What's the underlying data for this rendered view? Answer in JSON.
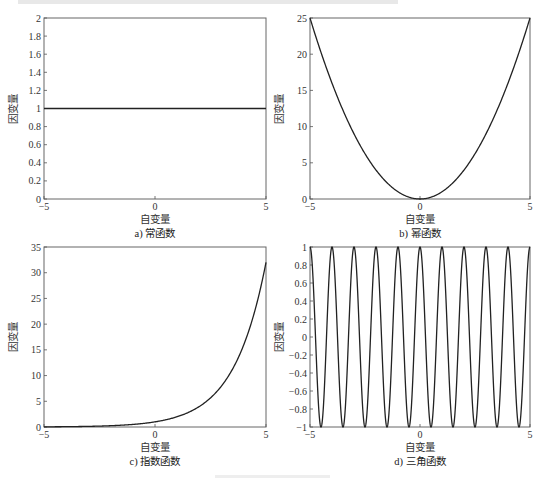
{
  "figure_caption_top": "",
  "chart_data": [
    {
      "id": "a",
      "type": "line",
      "function": "y = 1",
      "title": "",
      "caption": "a) 常函数",
      "xlabel": "自变量",
      "ylabel": "因变量",
      "xlim": [
        -5,
        5
      ],
      "ylim": [
        0,
        2
      ],
      "xticks": [
        -5,
        0,
        5
      ],
      "yticks": [
        0,
        0.2,
        0.4,
        0.6,
        0.8,
        1,
        1.2,
        1.4,
        1.6,
        1.8,
        2
      ],
      "xtick_labels": [
        "−5",
        "0",
        "5"
      ],
      "ytick_labels": [
        "0",
        "0.2",
        "0.4",
        "0.6",
        "0.8",
        "1",
        "1.2",
        "1.4",
        "1.6",
        "1.8",
        "2"
      ],
      "series": [
        {
          "name": "常函数",
          "x": [
            -5,
            5
          ],
          "y": [
            1,
            1
          ]
        }
      ],
      "grid": false
    },
    {
      "id": "b",
      "type": "line",
      "function": "y = x^2",
      "caption": "b) 幂函数",
      "xlabel": "自变量",
      "ylabel": "因变量",
      "xlim": [
        -5,
        5
      ],
      "ylim": [
        0,
        25
      ],
      "xticks": [
        -5,
        0,
        5
      ],
      "yticks": [
        0,
        5,
        10,
        15,
        20,
        25
      ],
      "xtick_labels": [
        "−5",
        "0",
        "5"
      ],
      "ytick_labels": [
        "0",
        "5",
        "10",
        "15",
        "20",
        "25"
      ],
      "series": [
        {
          "name": "幂函数",
          "x": [
            -5,
            -4,
            -3,
            -2,
            -1,
            0,
            1,
            2,
            3,
            4,
            5
          ],
          "y": [
            25,
            16,
            9,
            4,
            1,
            0,
            1,
            4,
            9,
            16,
            25
          ]
        }
      ],
      "grid": false
    },
    {
      "id": "c",
      "type": "line",
      "function": "y = 2^x",
      "caption": "c) 指数函数",
      "xlabel": "自变量",
      "ylabel": "因变量",
      "xlim": [
        -5,
        5
      ],
      "ylim": [
        0,
        35
      ],
      "xticks": [
        -5,
        0,
        5
      ],
      "yticks": [
        0,
        5,
        10,
        15,
        20,
        25,
        30,
        35
      ],
      "xtick_labels": [
        "−5",
        "0",
        "5"
      ],
      "ytick_labels": [
        "0",
        "5",
        "10",
        "15",
        "20",
        "25",
        "30",
        "35"
      ],
      "series": [
        {
          "name": "指数函数",
          "x": [
            -5,
            -4,
            -3,
            -2,
            -1,
            0,
            1,
            2,
            3,
            4,
            5
          ],
          "y": [
            0.03125,
            0.0625,
            0.125,
            0.25,
            0.5,
            1,
            2,
            4,
            8,
            16,
            32
          ]
        }
      ],
      "grid": false
    },
    {
      "id": "d",
      "type": "line",
      "function": "y = cos(2πx)",
      "caption": "d) 三角函数",
      "xlabel": "自变量",
      "ylabel": "因变量",
      "xlim": [
        -5,
        5
      ],
      "ylim": [
        -1,
        1
      ],
      "xticks": [
        -5,
        0,
        5
      ],
      "yticks": [
        -1,
        -0.8,
        -0.6,
        -0.4,
        -0.2,
        0,
        0.2,
        0.4,
        0.6,
        0.8,
        1
      ],
      "xtick_labels": [
        "−5",
        "0",
        "5"
      ],
      "ytick_labels": [
        "−1",
        "−0.8",
        "−0.6",
        "−0.4",
        "−0.2",
        "0",
        "0.2",
        "0.4",
        "0.6",
        "0.8",
        "1"
      ],
      "series": [
        {
          "name": "三角函数",
          "x": [
            -5,
            -4.5,
            -4,
            -3.5,
            -3,
            -2.5,
            -2,
            -1.5,
            -1,
            -0.5,
            0,
            0.5,
            1,
            1.5,
            2,
            2.5,
            3,
            3.5,
            4,
            4.5,
            5
          ],
          "y": [
            1,
            -1,
            1,
            -1,
            1,
            -1,
            1,
            -1,
            1,
            -1,
            1,
            -1,
            1,
            -1,
            1,
            -1,
            1,
            -1,
            1,
            -1,
            1
          ]
        }
      ],
      "grid": false
    }
  ]
}
